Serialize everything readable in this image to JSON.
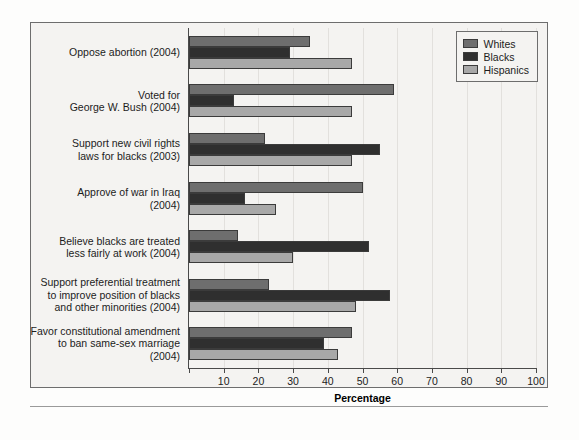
{
  "chart_data": {
    "type": "bar",
    "orientation": "horizontal",
    "title": "",
    "xlabel": "Percentage",
    "ylabel": "",
    "xlim": [
      0,
      100
    ],
    "xticks": [
      0,
      10,
      20,
      30,
      40,
      50,
      60,
      70,
      80,
      90,
      100
    ],
    "xticklabels": [
      "",
      "10",
      "20",
      "30",
      "40",
      "50",
      "60",
      "70",
      "80",
      "90",
      "100"
    ],
    "grid": true,
    "legend_position": "top-right",
    "categories": [
      "Oppose abortion (2004)",
      "Voted for\nGeorge W. Bush (2004)",
      "Support new civil rights\nlaws for blacks (2003)",
      "Approve of war in Iraq\n(2004)",
      "Believe blacks are treated\nless fairly at work (2004)",
      "Support preferential treatment\nto improve position of blacks\nand other minorities (2004)",
      "Favor constitutional amendment\nto ban same-sex marriage (2004)"
    ],
    "series": [
      {
        "name": "Whites",
        "color": "#6e6e6e",
        "values": [
          35,
          59,
          22,
          50,
          14,
          23,
          47
        ]
      },
      {
        "name": "Blacks",
        "color": "#2f2f2f",
        "values": [
          29,
          13,
          55,
          16,
          52,
          58,
          39
        ]
      },
      {
        "name": "Hispanics",
        "color": "#a8a8a8",
        "values": [
          47,
          47,
          47,
          25,
          30,
          48,
          43
        ]
      }
    ]
  },
  "legend": {
    "items": [
      {
        "label": "Whites",
        "color": "#6e6e6e"
      },
      {
        "label": "Blacks",
        "color": "#2f2f2f"
      },
      {
        "label": "Hispanics",
        "color": "#a8a8a8"
      }
    ]
  },
  "axis": {
    "x_title": "Percentage"
  }
}
